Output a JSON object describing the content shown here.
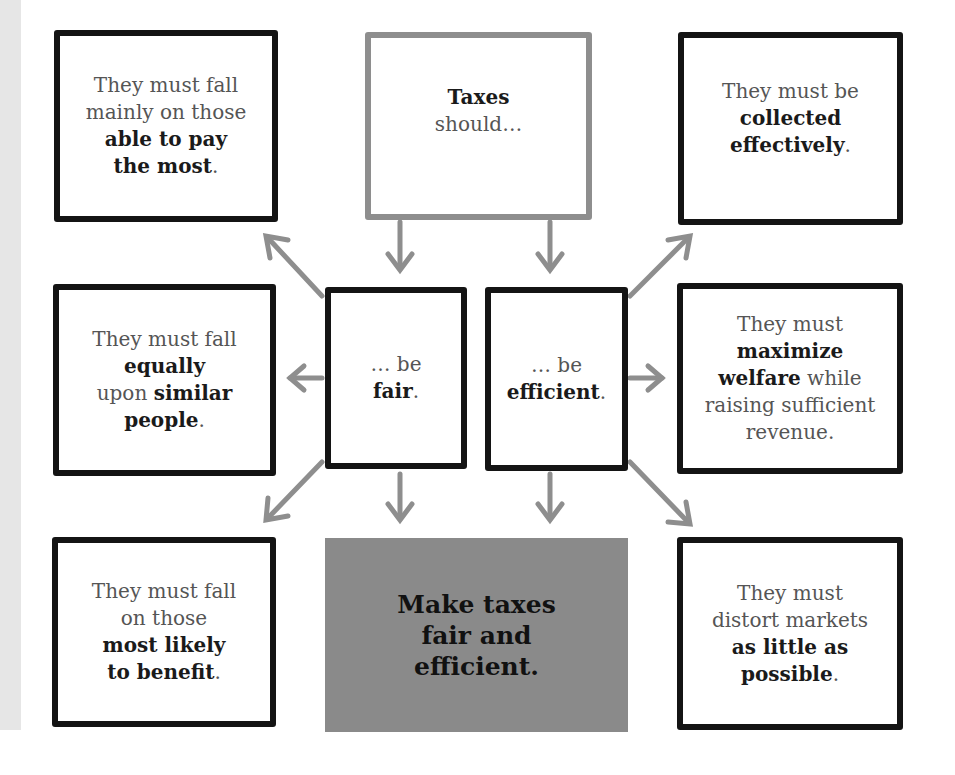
{
  "diagram": {
    "root": {
      "bold": "Taxes",
      "normal": "should…",
      "border_color": "#8e8e8e"
    },
    "branches": {
      "fair": {
        "prefix": "… be",
        "bold": "fair",
        "suffix": "."
      },
      "efficient": {
        "prefix": "… be",
        "bold": "efficient",
        "suffix": "."
      }
    },
    "fair_criteria": [
      {
        "id": "ability",
        "lines": [
          "They must fall",
          "mainly on those"
        ],
        "bold_lines": [
          "able to pay",
          "the most"
        ],
        "suffix": "."
      },
      {
        "id": "equal",
        "l1": "They must fall",
        "b1": "equally",
        "l2": "upon ",
        "b2": "similar",
        "b3": "people",
        "suffix": "."
      },
      {
        "id": "benefit",
        "lines": [
          "They must fall",
          "on those"
        ],
        "bold_lines": [
          "most likely",
          "to benefit"
        ],
        "suffix": "."
      }
    ],
    "efficient_criteria": [
      {
        "id": "collection",
        "lines": [
          "They must be"
        ],
        "bold_lines": [
          "collected",
          "effectively"
        ],
        "suffix": "."
      },
      {
        "id": "welfare",
        "l1": "They must",
        "b1": "maximize",
        "b2": "welfare",
        "l2": " while",
        "l3": "raising sufficient",
        "l4": "revenue."
      },
      {
        "id": "distortion",
        "lines": [
          "They must",
          "distort markets"
        ],
        "bold_lines": [
          "as little as",
          "possible"
        ],
        "suffix": "."
      }
    ],
    "conclusion": {
      "lines": [
        "Make taxes",
        "fair and",
        "efficient."
      ],
      "fill_color": "#8a8a8a"
    },
    "colors": {
      "box_border": "#141414",
      "arrow": "#8e8e8e",
      "side_strip": "#e6e6e6"
    }
  }
}
